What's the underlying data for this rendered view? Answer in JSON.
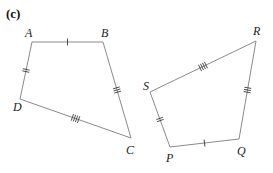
{
  "figure": {
    "label": "(c)",
    "colors": {
      "edge": "#8a8a8a",
      "tick": "#3a3a3a",
      "text": "#222222"
    }
  },
  "shapes": [
    {
      "name": "ABCD",
      "vertices": [
        {
          "label": "A",
          "x": 32,
          "y": 42,
          "lx": 25,
          "ly": 37
        },
        {
          "label": "B",
          "x": 103,
          "y": 42,
          "lx": 101,
          "ly": 37
        },
        {
          "label": "C",
          "x": 131,
          "y": 138,
          "lx": 126,
          "ly": 154
        },
        {
          "label": "D",
          "x": 20,
          "y": 99,
          "lx": 13,
          "ly": 111
        }
      ],
      "edges": [
        {
          "from": "A",
          "to": "B",
          "ticks": 1
        },
        {
          "from": "B",
          "to": "C",
          "ticks": 3
        },
        {
          "from": "C",
          "to": "D",
          "ticks": 4
        },
        {
          "from": "D",
          "to": "A",
          "ticks": 2
        }
      ]
    },
    {
      "name": "PQRS",
      "vertices": [
        {
          "label": "P",
          "x": 170,
          "y": 147,
          "lx": 166,
          "ly": 162
        },
        {
          "label": "Q",
          "x": 239,
          "y": 139,
          "lx": 237,
          "ly": 155
        },
        {
          "label": "R",
          "x": 256,
          "y": 41,
          "lx": 253,
          "ly": 35
        },
        {
          "label": "S",
          "x": 150,
          "y": 92,
          "lx": 143,
          "ly": 90
        }
      ],
      "edges": [
        {
          "from": "P",
          "to": "Q",
          "ticks": 1
        },
        {
          "from": "Q",
          "to": "R",
          "ticks": 3
        },
        {
          "from": "R",
          "to": "S",
          "ticks": 4
        },
        {
          "from": "S",
          "to": "P",
          "ticks": 2
        }
      ]
    }
  ]
}
